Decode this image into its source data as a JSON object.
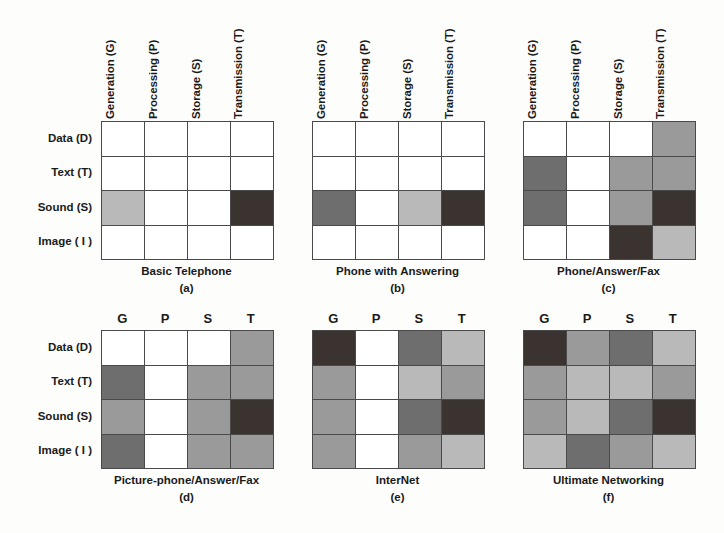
{
  "figure": {
    "row_labels": [
      "Data (D)",
      "Text (T)",
      "Sound (S)",
      "Image ( I )"
    ],
    "column_labels_long": [
      "Generation (G)",
      "Processing (P)",
      "Storage (S)",
      "Transmission (T)"
    ],
    "column_labels_short": [
      "G",
      "P",
      "S",
      "T"
    ],
    "palette": {
      "empty": "#ffffff",
      "light": "#b9b9b9",
      "medium": "#9a9a9a",
      "dark": "#6e6e6e",
      "darkest": "#3a3330",
      "grid_line": "#4a4a4a"
    }
  },
  "chart_data": {
    "type": "heatmap",
    "title": "",
    "xlabel": "",
    "ylabel": "",
    "categories_x": [
      "Generation (G)",
      "Processing (P)",
      "Storage (S)",
      "Transmission (T)"
    ],
    "categories_y": [
      "Data (D)",
      "Text (T)",
      "Sound (S)",
      "Image ( I )"
    ],
    "scale": [
      "empty",
      "light",
      "medium",
      "dark",
      "darkest"
    ],
    "panels": [
      {
        "id": "a",
        "label": "(a)",
        "title": "Basic Telephone",
        "header_style": "rotated",
        "matrix": [
          [
            "empty",
            "empty",
            "empty",
            "empty"
          ],
          [
            "empty",
            "empty",
            "empty",
            "empty"
          ],
          [
            "light",
            "empty",
            "empty",
            "darkest"
          ],
          [
            "empty",
            "empty",
            "empty",
            "empty"
          ]
        ]
      },
      {
        "id": "b",
        "label": "(b)",
        "title": "Phone with Answering",
        "header_style": "rotated",
        "matrix": [
          [
            "empty",
            "empty",
            "empty",
            "empty"
          ],
          [
            "empty",
            "empty",
            "empty",
            "empty"
          ],
          [
            "dark",
            "empty",
            "light",
            "darkest"
          ],
          [
            "empty",
            "empty",
            "empty",
            "empty"
          ]
        ]
      },
      {
        "id": "c",
        "label": "(c)",
        "title": "Phone/Answer/Fax",
        "header_style": "rotated",
        "matrix": [
          [
            "empty",
            "empty",
            "empty",
            "medium"
          ],
          [
            "dark",
            "empty",
            "medium",
            "medium"
          ],
          [
            "dark",
            "empty",
            "medium",
            "darkest"
          ],
          [
            "empty",
            "empty",
            "darkest",
            "light"
          ]
        ]
      },
      {
        "id": "d",
        "label": "(d)",
        "title": "Picture-phone/Answer/Fax",
        "header_style": "short",
        "matrix": [
          [
            "empty",
            "empty",
            "empty",
            "medium"
          ],
          [
            "dark",
            "empty",
            "medium",
            "medium"
          ],
          [
            "medium",
            "empty",
            "medium",
            "darkest"
          ],
          [
            "dark",
            "empty",
            "medium",
            "medium"
          ]
        ]
      },
      {
        "id": "e",
        "label": "(e)",
        "title": "InterNet",
        "header_style": "short",
        "matrix": [
          [
            "darkest",
            "empty",
            "dark",
            "light"
          ],
          [
            "medium",
            "empty",
            "light",
            "medium"
          ],
          [
            "medium",
            "empty",
            "dark",
            "darkest"
          ],
          [
            "medium",
            "empty",
            "medium",
            "light"
          ]
        ]
      },
      {
        "id": "f",
        "label": "(f)",
        "title": "Ultimate Networking",
        "header_style": "short",
        "matrix": [
          [
            "darkest",
            "medium",
            "dark",
            "light"
          ],
          [
            "medium",
            "light",
            "light",
            "medium"
          ],
          [
            "medium",
            "light",
            "dark",
            "darkest"
          ],
          [
            "light",
            "dark",
            "medium",
            "light"
          ]
        ]
      }
    ]
  }
}
